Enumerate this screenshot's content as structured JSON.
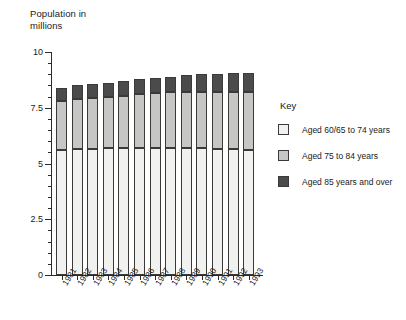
{
  "axes": {
    "y_title_line1": "Population in",
    "y_title_line2": "millions",
    "y_ticks": [
      "0",
      "2.5",
      "5",
      "7.5",
      "10"
    ]
  },
  "legend": {
    "title": "Key",
    "items": [
      {
        "label": "Aged 60/65 to 74 years",
        "color": "#f1f1ef"
      },
      {
        "label": "Aged 75 to 84 years",
        "color": "#c6c6c4"
      },
      {
        "label": "Aged 85 years and over",
        "color": "#4b4b4b"
      }
    ]
  },
  "chart_data": {
    "type": "bar",
    "stacked": true,
    "title": "",
    "subtitle": "",
    "xlabel": "",
    "ylabel": "Population in millions",
    "ylim": [
      0,
      10
    ],
    "yticks": [
      0,
      2.5,
      5,
      7.5,
      10
    ],
    "grid": false,
    "legend_position": "right",
    "categories": [
      "1981",
      "1982",
      "1983",
      "1984",
      "1985",
      "1986",
      "1987",
      "1988",
      "1989",
      "1990",
      "1991",
      "1992",
      "1993"
    ],
    "series": [
      {
        "name": "Aged 60/65 to 74 years",
        "color": "#f1f1ef",
        "values": [
          5.6,
          5.65,
          5.65,
          5.7,
          5.7,
          5.7,
          5.7,
          5.7,
          5.7,
          5.7,
          5.65,
          5.65,
          5.6
        ]
      },
      {
        "name": "Aged 75 to 84 years",
        "color": "#c6c6c4",
        "values": [
          2.2,
          2.25,
          2.3,
          2.3,
          2.35,
          2.4,
          2.45,
          2.5,
          2.5,
          2.5,
          2.55,
          2.55,
          2.6
        ]
      },
      {
        "name": "Aged 85 years and over",
        "color": "#4b4b4b",
        "values": [
          0.6,
          0.6,
          0.6,
          0.6,
          0.65,
          0.7,
          0.7,
          0.7,
          0.75,
          0.8,
          0.8,
          0.85,
          0.85
        ]
      }
    ],
    "totals": [
      8.4,
      8.5,
      8.55,
      8.6,
      8.7,
      8.8,
      8.85,
      8.9,
      8.95,
      9.0,
      9.0,
      9.05,
      9.05
    ]
  }
}
